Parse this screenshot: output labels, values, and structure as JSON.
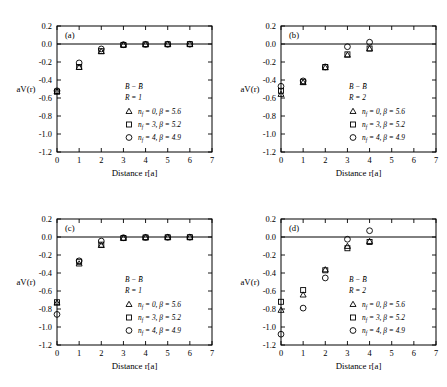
{
  "figure": {
    "axis": {
      "xlabel": "Distance r[a]",
      "ylabel": "aV(r)",
      "xlim": [
        0,
        7
      ],
      "ylim": [
        -1.2,
        0.2
      ],
      "xticks": [
        "0",
        "1",
        "2",
        "3",
        "4",
        "5",
        "6",
        "7"
      ],
      "yticks": [
        "0.2",
        "0.0",
        "-0.2",
        "-0.4",
        "-0.6",
        "-0.8",
        "-1.0",
        "-1.2"
      ],
      "grid": false
    },
    "legend_common": {
      "entries": [
        {
          "marker": "triangle",
          "nf_label": "n",
          "nf_sub": "f",
          "text": " = 0, β = 5.6"
        },
        {
          "marker": "square",
          "nf_label": "n",
          "nf_sub": "f",
          "text": " = 3, β = 5.2"
        },
        {
          "marker": "circle",
          "nf_label": "n",
          "nf_sub": "f",
          "text": " = 4, β = 4.9"
        }
      ]
    },
    "panels": [
      {
        "tag": "(a)",
        "channel": "B − B̄",
        "R": "R = 1"
      },
      {
        "tag": "(b)",
        "channel": "B − B̄",
        "R": "R = 2"
      },
      {
        "tag": "(c)",
        "channel": "B − B̄",
        "R": "R = 1"
      },
      {
        "tag": "(d)",
        "channel": "B − B̄",
        "R": "R = 2"
      }
    ]
  },
  "chart_data": [
    {
      "type": "scatter",
      "panel": "(a)",
      "title": "B − Bbar, R = 1",
      "xlabel": "Distance r[a]",
      "ylabel": "aV(r)",
      "xlim": [
        0,
        7
      ],
      "ylim": [
        -1.2,
        0.2
      ],
      "series": [
        {
          "name": "nf = 0, beta = 5.6",
          "marker": "triangle",
          "x": [
            0,
            1,
            2,
            3,
            4,
            5,
            6
          ],
          "y": [
            -0.53,
            -0.26,
            -0.085,
            -0.012,
            -0.006,
            -0.004,
            -0.003
          ]
        },
        {
          "name": "nf = 3, beta = 5.2",
          "marker": "square",
          "x": [
            0,
            1,
            2,
            3,
            4,
            5,
            6
          ],
          "y": [
            -0.53,
            -0.255,
            -0.08,
            -0.01,
            -0.005,
            -0.003,
            -0.002
          ]
        },
        {
          "name": "nf = 4, beta = 4.9",
          "marker": "circle",
          "x": [
            0,
            1,
            2,
            3,
            4,
            5,
            6
          ],
          "y": [
            -0.52,
            -0.21,
            -0.055,
            -0.008,
            -0.004,
            -0.003,
            -0.002
          ]
        }
      ]
    },
    {
      "type": "scatter",
      "panel": "(b)",
      "title": "B − Bbar, R = 2",
      "xlabel": "Distance r[a]",
      "ylabel": "aV(r)",
      "xlim": [
        0,
        7
      ],
      "ylim": [
        -1.2,
        0.2
      ],
      "series": [
        {
          "name": "nf = 0, beta = 5.6",
          "marker": "triangle",
          "x": [
            0,
            1,
            2,
            3,
            4
          ],
          "y": [
            -0.56,
            -0.43,
            -0.265,
            -0.125,
            -0.055
          ]
        },
        {
          "name": "nf = 3, beta = 5.2",
          "marker": "square",
          "x": [
            0,
            1,
            2,
            3,
            4
          ],
          "y": [
            -0.52,
            -0.42,
            -0.255,
            -0.115,
            -0.05
          ]
        },
        {
          "name": "nf = 4, beta = 4.9",
          "marker": "circle",
          "x": [
            0,
            1,
            2,
            3,
            4
          ],
          "y": [
            -0.47,
            -0.41,
            -0.255,
            -0.03,
            0.02
          ]
        }
      ]
    },
    {
      "type": "scatter",
      "panel": "(c)",
      "title": "B − Bbar, R = 1",
      "xlabel": "Distance r[a]",
      "ylabel": "aV(r)",
      "xlim": [
        0,
        7
      ],
      "ylim": [
        -1.2,
        0.2
      ],
      "series": [
        {
          "name": "nf = 0, beta = 5.6",
          "marker": "triangle",
          "x": [
            0,
            1,
            2,
            3,
            4,
            5,
            6
          ],
          "y": [
            -0.735,
            -0.3,
            -0.095,
            -0.014,
            -0.007,
            -0.005,
            -0.003
          ]
        },
        {
          "name": "nf = 3, beta = 5.2",
          "marker": "square",
          "x": [
            0,
            1,
            2,
            3,
            4,
            5,
            6
          ],
          "y": [
            -0.725,
            -0.275,
            -0.085,
            -0.012,
            -0.006,
            -0.004,
            -0.003
          ]
        },
        {
          "name": "nf = 4, beta = 4.9",
          "marker": "circle",
          "x": [
            0,
            1,
            2,
            3,
            4,
            5,
            6
          ],
          "y": [
            -0.86,
            -0.265,
            -0.045,
            -0.008,
            -0.004,
            -0.003,
            -0.002
          ]
        }
      ]
    },
    {
      "type": "scatter",
      "panel": "(d)",
      "title": "B − Bbar, R = 2",
      "xlabel": "Distance r[a]",
      "ylabel": "aV(r)",
      "xlim": [
        0,
        7
      ],
      "ylim": [
        -1.2,
        0.2
      ],
      "series": [
        {
          "name": "nf = 0, beta = 5.6",
          "marker": "triangle",
          "x": [
            0,
            1,
            2,
            3,
            4
          ],
          "y": [
            -0.815,
            -0.645,
            -0.365,
            -0.105,
            -0.05
          ]
        },
        {
          "name": "nf = 3, beta = 5.2",
          "marker": "square",
          "x": [
            0,
            1,
            2,
            3,
            4
          ],
          "y": [
            -0.72,
            -0.59,
            -0.37,
            -0.125,
            -0.055
          ]
        },
        {
          "name": "nf = 4, beta = 4.9",
          "marker": "circle",
          "x": [
            0,
            1,
            2,
            3,
            4
          ],
          "y": [
            -1.08,
            -0.79,
            -0.455,
            -0.025,
            0.07
          ]
        }
      ]
    }
  ]
}
